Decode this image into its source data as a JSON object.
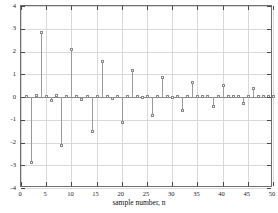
{
  "chart_data": {
    "type": "stem",
    "title": "",
    "xlabel": "sample number, n",
    "ylabel": "",
    "xlim": [
      0,
      50
    ],
    "ylim": [
      -4,
      4
    ],
    "xticks": [
      0,
      5,
      10,
      15,
      20,
      25,
      30,
      35,
      40,
      45,
      50
    ],
    "yticks": [
      -4,
      -3,
      -2,
      -1,
      0,
      1,
      2,
      3,
      4
    ],
    "grid": true,
    "legend": null,
    "marker": "circle-open",
    "baseline": 0,
    "x": [
      1,
      2,
      3,
      4,
      5,
      6,
      7,
      8,
      9,
      10,
      11,
      12,
      13,
      14,
      15,
      16,
      17,
      18,
      19,
      20,
      21,
      22,
      23,
      24,
      25,
      26,
      27,
      28,
      29,
      30,
      31,
      32,
      33,
      34,
      35,
      36,
      37,
      38,
      39,
      40,
      41,
      42,
      43,
      44,
      45,
      46,
      47,
      48,
      49,
      50
    ],
    "values": [
      0.02,
      -2.92,
      0.03,
      2.82,
      0.02,
      -0.16,
      0.03,
      -2.14,
      0.02,
      2.07,
      0.02,
      -0.12,
      0.02,
      -1.55,
      0.02,
      1.52,
      0.02,
      -0.07,
      0.02,
      -1.13,
      0.02,
      1.13,
      0.02,
      -0.03,
      0.02,
      -0.85,
      0.02,
      0.83,
      0.02,
      -0.04,
      0.02,
      -0.62,
      0.02,
      0.63,
      0.02,
      -0.02,
      0.02,
      -0.45,
      0.02,
      0.47,
      0.02,
      -0.02,
      0.02,
      -0.31,
      0.02,
      0.33,
      0.02,
      -0.01,
      0.02,
      -0.02
    ],
    "series_name": "impulse response"
  },
  "axis": {
    "x_tick_labels": [
      "0",
      "5",
      "10",
      "15",
      "20",
      "25",
      "30",
      "35",
      "40",
      "45",
      "50"
    ],
    "y_tick_labels": [
      "4",
      "3",
      "2",
      "1",
      "0",
      "-1",
      "-2",
      "-3",
      "-4"
    ],
    "x_title": "sample number, n"
  },
  "colors": {
    "background": "#ffffff",
    "frame": "#6e6e6e",
    "grid": "#d9d9d9",
    "stem": "#9a9a9a",
    "marker_edge": "#8a8a8a",
    "text": "#1a1a1a"
  }
}
